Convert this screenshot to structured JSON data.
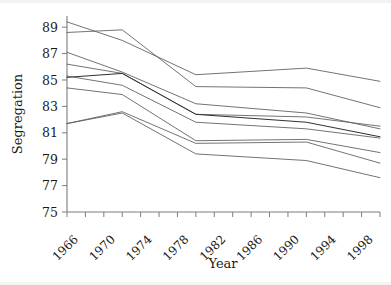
{
  "chart_data": {
    "type": "line",
    "title": "",
    "xlabel": "Year",
    "ylabel": "Segregation",
    "xlim": [
      1966,
      2000
    ],
    "ylim": [
      75,
      90
    ],
    "xticks": [
      1966,
      1968,
      1970,
      1972,
      1974,
      1976,
      1978,
      1980,
      1982,
      1984,
      1986,
      1988,
      1990,
      1992,
      1994,
      1996,
      1998,
      2000
    ],
    "xtick_labels": [
      "1966",
      "1970",
      "1974",
      "1978",
      "1982",
      "1986",
      "1990",
      "1994",
      "1998"
    ],
    "xtick_labeled_values": [
      1966,
      1970,
      1974,
      1978,
      1982,
      1986,
      1990,
      1994,
      1998
    ],
    "yticks": [
      75,
      77,
      79,
      81,
      83,
      85,
      87,
      89
    ],
    "ytick_labels": [
      "75",
      "77",
      "79",
      "81",
      "83",
      "85",
      "87",
      "89"
    ],
    "grid": false,
    "legend": "none",
    "x": [
      1966,
      1972,
      1980,
      1992,
      2000
    ],
    "series": [
      {
        "name": "series-1",
        "values": [
          89.4,
          88.0,
          85.4,
          85.9,
          84.9
        ],
        "emphasis": "normal"
      },
      {
        "name": "series-2",
        "values": [
          88.6,
          88.8,
          84.5,
          84.4,
          82.9
        ],
        "emphasis": "normal"
      },
      {
        "name": "series-3",
        "values": [
          87.1,
          85.6,
          83.2,
          82.5,
          81.3
        ],
        "emphasis": "normal"
      },
      {
        "name": "series-4",
        "values": [
          86.2,
          85.5,
          82.4,
          82.2,
          81.5
        ],
        "emphasis": "normal"
      },
      {
        "name": "series-5",
        "values": [
          85.2,
          85.5,
          82.4,
          81.8,
          80.7
        ],
        "emphasis": "dark"
      },
      {
        "name": "series-6",
        "values": [
          85.3,
          84.6,
          81.8,
          81.3,
          80.6
        ],
        "emphasis": "normal"
      },
      {
        "name": "series-7",
        "values": [
          84.4,
          83.9,
          80.4,
          80.5,
          79.5
        ],
        "emphasis": "normal"
      },
      {
        "name": "series-8",
        "values": [
          81.7,
          82.6,
          80.2,
          80.3,
          78.7
        ],
        "emphasis": "normal"
      },
      {
        "name": "series-9",
        "values": [
          81.7,
          82.5,
          79.4,
          78.9,
          77.6
        ],
        "emphasis": "normal"
      }
    ]
  },
  "axis": {
    "y_title": "Segregation",
    "x_title": "Year"
  }
}
